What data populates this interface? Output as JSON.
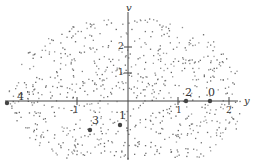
{
  "figure": {
    "axes": {
      "vertical_label": "v",
      "horizontal_label": "y",
      "y_ticks": [
        "2",
        "1"
      ],
      "x_ticks": [
        "-2",
        "-1",
        "1",
        "2"
      ]
    },
    "points": [
      {
        "label": "4",
        "x": 7,
        "y": 103
      },
      {
        "label": "3",
        "x": 90,
        "y": 130
      },
      {
        "label": "1",
        "x": 120,
        "y": 125
      },
      {
        "label": "2",
        "x": 186,
        "y": 101
      },
      {
        "label": "0",
        "x": 210,
        "y": 101
      }
    ],
    "colors": {
      "dots": "#555555",
      "axes": "#444444",
      "background": "#ffffff"
    }
  }
}
